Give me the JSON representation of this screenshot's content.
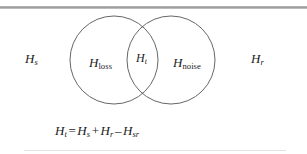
{
  "figure": {
    "type": "venn-diagram",
    "background_color": "#ffffff",
    "stroke_color": "#555555",
    "text_color": "#1c1c1c",
    "rule_color": "#9a9a9a"
  },
  "diagram": {
    "left_circle": {
      "name": "loss-circle",
      "label_base": "H",
      "label_sub": "loss",
      "cx": 114,
      "cy": 60,
      "r": 44
    },
    "right_circle": {
      "name": "noise-circle",
      "label_base": "H",
      "label_sub": "noise",
      "cx": 171,
      "cy": 60,
      "r": 44
    },
    "intersection": {
      "name": "total-region",
      "label_base": "H",
      "label_sub": "t"
    },
    "outer_left": {
      "label_base": "H",
      "label_sub": "s"
    },
    "outer_right": {
      "label_base": "H",
      "label_sub": "r"
    }
  },
  "equation": {
    "lhs_base": "H",
    "lhs_sub": "t",
    "equals": "=",
    "term1_base": "H",
    "term1_sub": "s",
    "plus": "+",
    "term2_base": "H",
    "term2_sub": "r",
    "minus": "–",
    "term3_base": "H",
    "term3_sub": "sr",
    "full_text": "Ht = Hs + Hr – Hsr"
  }
}
